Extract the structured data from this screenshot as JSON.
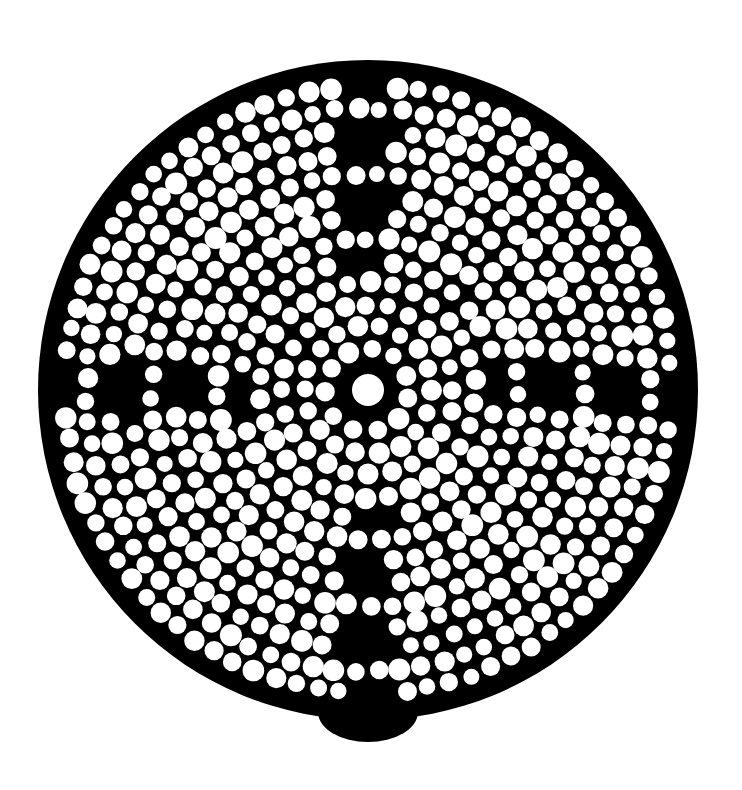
{
  "artwork": {
    "description": "Black circular disc filled with white dots arranged in concentric rings around a central dot, with dark cross-shaped arms extending in four directions",
    "colors": {
      "background": "#ffffff",
      "disc": "#000000",
      "dots": "#ffffff"
    },
    "disc": {
      "cx": 368,
      "cy": 390,
      "r": 330
    },
    "center_dot": {
      "r": 16
    },
    "rings": 14,
    "arms": [
      "up",
      "down",
      "left",
      "right"
    ]
  }
}
